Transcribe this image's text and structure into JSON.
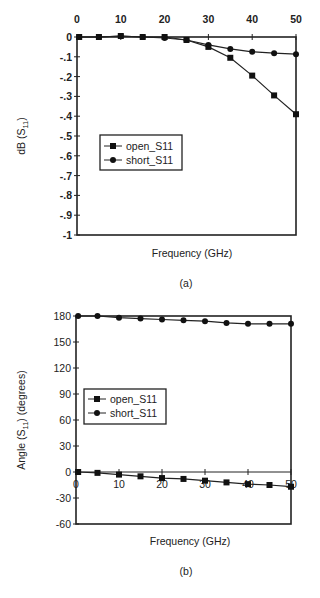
{
  "chart_data": [
    {
      "type": "line",
      "panel_label": "(a)",
      "title": "",
      "xlabel": "Frequency (GHz)",
      "ylabel": "dB (S11)",
      "xlim": [
        0,
        50
      ],
      "ylim": [
        -1,
        0
      ],
      "x_ticks": [
        0,
        10,
        20,
        30,
        40,
        50
      ],
      "y_ticks": [
        0,
        -0.1,
        -0.2,
        -0.3,
        -0.4,
        -0.5,
        -0.6,
        -0.7,
        -0.8,
        -0.9,
        -1
      ],
      "x_tick_position": "top",
      "grid": false,
      "legend_position": "center-left",
      "x": [
        0.5,
        5,
        10,
        15,
        20,
        25,
        30,
        35,
        40,
        45,
        50
      ],
      "series": [
        {
          "name": "open_S11",
          "marker": "square",
          "values": [
            0,
            0,
            0.005,
            0,
            0,
            -0.015,
            -0.05,
            -0.105,
            -0.195,
            -0.295,
            -0.39
          ]
        },
        {
          "name": "short_S11",
          "marker": "circle",
          "values": [
            0,
            0,
            0.005,
            0,
            -0.005,
            -0.015,
            -0.04,
            -0.06,
            -0.075,
            -0.082,
            -0.087
          ]
        }
      ]
    },
    {
      "type": "line",
      "panel_label": "(b)",
      "title": "",
      "xlabel": "Frequency (GHz)",
      "ylabel": "Angle (S11) (degrees)",
      "xlim": [
        0,
        50
      ],
      "ylim": [
        -60,
        180
      ],
      "x_ticks": [
        0,
        10,
        20,
        30,
        40,
        50
      ],
      "y_ticks": [
        180,
        150,
        120,
        90,
        60,
        30,
        0,
        -30,
        -60
      ],
      "x_tick_position": "at y=0",
      "grid": false,
      "legend_position": "center-left",
      "x": [
        0.5,
        5,
        10,
        15,
        20,
        25,
        30,
        35,
        40,
        45,
        50
      ],
      "series": [
        {
          "name": "open_S11",
          "marker": "square",
          "values": [
            0,
            -1,
            -3,
            -5,
            -7,
            -8,
            -10,
            -12,
            -14,
            -15,
            -17
          ]
        },
        {
          "name": "short_S11",
          "marker": "circle",
          "values": [
            180,
            180,
            178,
            177,
            176,
            175,
            174,
            172,
            171,
            171,
            171
          ]
        }
      ]
    }
  ],
  "panels": {
    "a": {
      "ylabel_main": "dB (S",
      "ylabel_sub": "11",
      "ylabel_end": ")",
      "xlabel": "Frequency (GHz)",
      "caption": "(a)",
      "legend": [
        "open_S11",
        "short_S11"
      ]
    },
    "b": {
      "ylabel_main": "Angle (S",
      "ylabel_sub": "11",
      "ylabel_end": ") (degrees)",
      "xlabel": "Frequency (GHz)",
      "caption": "(b)",
      "legend": [
        "open_S11",
        "short_S11"
      ]
    }
  }
}
